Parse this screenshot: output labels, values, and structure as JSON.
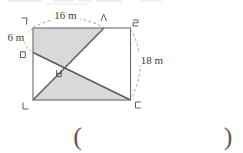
{
  "figure": {
    "dimension_labels": {
      "top": "16 m",
      "left": "6 m",
      "right": "18 m"
    },
    "vertex_labels": {
      "top_left": "ㄱ",
      "top_point": "ㅅ",
      "top_right": "ㄹ",
      "left_point": "ㅁ",
      "center": "ㅂ",
      "bottom_left": "ㄴ",
      "bottom_right": "ㄷ"
    },
    "colors": {
      "shaded_region": "#d9d9d9",
      "rectangle_outline": "#6b6b6b",
      "diagonal_line": "#5a5a5a",
      "dashed_dimension_arc": "#8f8f8f",
      "label_text": "#3d3d3d"
    }
  },
  "answer_blank": {
    "open": "(",
    "close": ")"
  }
}
